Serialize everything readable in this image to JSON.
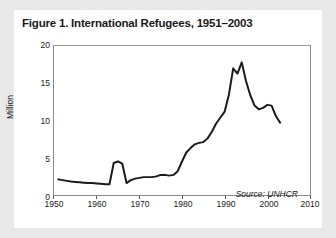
{
  "figure": {
    "title": "Figure 1. International Refugees, 1951–2003",
    "source_note": "Source: UNHCR",
    "background_color": "#e9e9e9",
    "card_color": "#ffffff",
    "line_color": "#1a1a1a",
    "frame_color": "#8a8a8a"
  },
  "chart_data": {
    "type": "line",
    "title": "Figure 1. International Refugees, 1951–2003",
    "xlabel": "",
    "ylabel": "Million",
    "xlim": [
      1950,
      2010
    ],
    "ylim": [
      0,
      20
    ],
    "xticks": [
      1950,
      1960,
      1970,
      1980,
      1990,
      2000,
      2010
    ],
    "yticks": [
      0,
      5,
      10,
      15,
      20
    ],
    "grid": false,
    "legend": null,
    "annotations": [
      "Source: UNHCR"
    ],
    "series": [
      {
        "name": "International Refugees",
        "units": "Million",
        "x": [
          1951,
          1952,
          1953,
          1954,
          1955,
          1956,
          1957,
          1958,
          1959,
          1960,
          1961,
          1962,
          1963,
          1964,
          1965,
          1966,
          1967,
          1968,
          1969,
          1970,
          1971,
          1972,
          1973,
          1974,
          1975,
          1976,
          1977,
          1978,
          1979,
          1980,
          1981,
          1982,
          1983,
          1984,
          1985,
          1986,
          1987,
          1988,
          1989,
          1990,
          1991,
          1992,
          1993,
          1994,
          1995,
          1996,
          1997,
          1998,
          1999,
          2000,
          2001,
          2002,
          2003
        ],
        "y": [
          2.1,
          2.0,
          1.9,
          1.8,
          1.75,
          1.7,
          1.65,
          1.6,
          1.6,
          1.55,
          1.5,
          1.45,
          1.45,
          4.3,
          4.5,
          4.2,
          1.6,
          2.0,
          2.2,
          2.3,
          2.4,
          2.4,
          2.4,
          2.5,
          2.7,
          2.7,
          2.6,
          2.7,
          3.2,
          4.5,
          5.7,
          6.3,
          6.8,
          7.0,
          7.1,
          7.6,
          8.5,
          9.6,
          10.4,
          11.2,
          13.5,
          17.0,
          16.3,
          17.8,
          15.3,
          13.4,
          12.0,
          11.5,
          11.7,
          12.1,
          12.0,
          10.6,
          9.7
        ]
      }
    ]
  },
  "axes": {
    "y_tick_labels": [
      "20",
      "15",
      "10",
      "5",
      "0"
    ],
    "x_tick_labels": [
      "1950",
      "1960",
      "1970",
      "1980",
      "1990",
      "2000",
      "2010"
    ],
    "y_axis_title": "Million"
  }
}
